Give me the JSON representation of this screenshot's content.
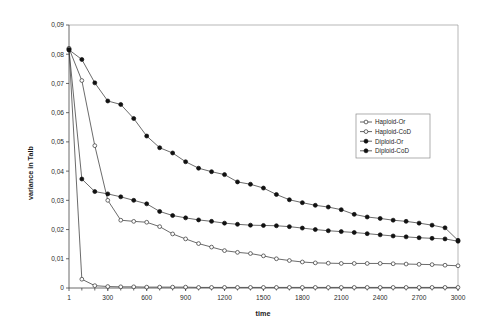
{
  "chart_data": {
    "type": "line",
    "title": "",
    "xlabel": "time",
    "ylabel": "variance in Talb",
    "xlim": [
      1,
      3000
    ],
    "ylim": [
      0,
      0.09
    ],
    "grid": false,
    "legend_position": "center-right",
    "x_ticks": [
      1,
      300,
      600,
      900,
      1200,
      1500,
      1800,
      2100,
      2400,
      2700,
      3000
    ],
    "x_tick_labels": [
      "1",
      "300",
      "600",
      "900",
      "1200",
      "1500",
      "1800",
      "2100",
      "2400",
      "2700",
      "3000"
    ],
    "x_minor_step": 100,
    "y_ticks": [
      0,
      0.01,
      0.02,
      0.03,
      0.04,
      0.05,
      0.06,
      0.07,
      0.08,
      0.09
    ],
    "y_tick_labels": [
      "0",
      "0,01",
      "0,02",
      "0,03",
      "0,04",
      "0,05",
      "0,06",
      "0,07",
      "0,08",
      "0,09"
    ],
    "x": [
      1,
      100,
      200,
      300,
      400,
      500,
      600,
      700,
      800,
      900,
      1000,
      1100,
      1200,
      1300,
      1400,
      1500,
      1600,
      1700,
      1800,
      1900,
      2000,
      2100,
      2200,
      2300,
      2400,
      2500,
      2600,
      2700,
      2800,
      2900,
      3000
    ],
    "series": [
      {
        "name": "Haploid-Or",
        "marker": "open-circle",
        "values": [
          0.082,
          0.003,
          0.0008,
          0.0005,
          0.0004,
          0.0004,
          0.0003,
          0.0003,
          0.0003,
          0.0003,
          0.0002,
          0.0002,
          0.0002,
          0.0002,
          0.0002,
          0.0002,
          0.0002,
          0.0002,
          0.0002,
          0.0002,
          0.0002,
          0.0002,
          0.0002,
          0.0002,
          0.0002,
          0.0002,
          0.0002,
          0.0002,
          0.0002,
          0.0002,
          0.0002
        ]
      },
      {
        "name": "Haploid-CoD",
        "marker": "open-circle",
        "values": [
          0.082,
          0.071,
          0.0487,
          0.03,
          0.0232,
          0.0228,
          0.0225,
          0.021,
          0.0185,
          0.0168,
          0.0152,
          0.014,
          0.0128,
          0.0122,
          0.0118,
          0.011,
          0.01,
          0.0094,
          0.0089,
          0.0086,
          0.0085,
          0.0084,
          0.0084,
          0.0084,
          0.0084,
          0.0083,
          0.0082,
          0.0081,
          0.008,
          0.0078,
          0.0076
        ]
      },
      {
        "name": "Diploid-Or",
        "marker": "filled-circle",
        "values": [
          0.0815,
          0.0373,
          0.033,
          0.0322,
          0.0312,
          0.03,
          0.0288,
          0.0262,
          0.0248,
          0.024,
          0.0233,
          0.0228,
          0.0222,
          0.0218,
          0.0215,
          0.0214,
          0.0213,
          0.021,
          0.0205,
          0.02,
          0.0196,
          0.0193,
          0.019,
          0.0186,
          0.0182,
          0.0178,
          0.0175,
          0.0172,
          0.017,
          0.0168,
          0.016
        ]
      },
      {
        "name": "Diploid-CoD",
        "marker": "filled-circle",
        "values": [
          0.0815,
          0.0782,
          0.0702,
          0.064,
          0.0628,
          0.058,
          0.052,
          0.048,
          0.0462,
          0.0432,
          0.041,
          0.0398,
          0.0388,
          0.0363,
          0.0355,
          0.0342,
          0.032,
          0.0302,
          0.0292,
          0.0283,
          0.0277,
          0.0268,
          0.0252,
          0.0243,
          0.0238,
          0.0232,
          0.0228,
          0.0222,
          0.0215,
          0.0206,
          0.0163
        ]
      }
    ]
  },
  "legend": {
    "items": [
      {
        "label": "Haploid-Or"
      },
      {
        "label": "Haploid-CoD"
      },
      {
        "label": "Diploid-Or"
      },
      {
        "label": "Diploid-CoD"
      }
    ]
  }
}
